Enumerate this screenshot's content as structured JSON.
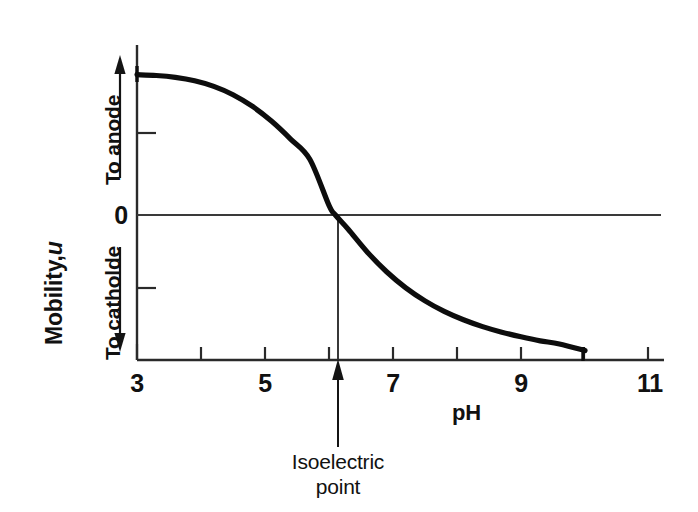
{
  "chart_data": {
    "type": "line",
    "title": "",
    "xlabel": "pH",
    "ylabel": "Mobility, u",
    "ylabel_plain": "Mobility,",
    "ylabel_italic": "u",
    "xlim": [
      3,
      11.3
    ],
    "ylim": [
      -1.12,
      1.12
    ],
    "grid": false,
    "legend": null,
    "xticks": [
      3,
      4,
      5,
      6,
      7,
      8,
      9,
      10,
      11
    ],
    "xticklabels": [
      "3",
      "",
      "5",
      "",
      "7",
      "",
      "9",
      "",
      "11"
    ],
    "xticklabels_shown": [
      "3",
      "5",
      "7",
      "9",
      "11"
    ],
    "yticks": [
      -0.55,
      0,
      0.55
    ],
    "yticklabels": [
      "",
      "0",
      ""
    ],
    "ytick_zero_label": "0",
    "zero_line": 0,
    "series": [
      {
        "name": "mobility",
        "x": [
          3.0,
          3.3,
          3.6,
          3.9,
          4.2,
          4.5,
          4.8,
          5.1,
          5.4,
          5.7,
          6.0,
          6.1,
          6.3,
          6.6,
          6.9,
          7.2,
          7.5,
          7.8,
          8.1,
          8.4,
          8.7,
          9.0,
          9.3,
          9.6,
          10.0
        ],
        "y": [
          0.905,
          0.9,
          0.888,
          0.866,
          0.83,
          0.776,
          0.702,
          0.606,
          0.49,
          0.36,
          0.062,
          0.0,
          -0.092,
          -0.24,
          -0.366,
          -0.47,
          -0.554,
          -0.622,
          -0.676,
          -0.72,
          -0.756,
          -0.786,
          -0.812,
          -0.832,
          -0.875
        ]
      }
    ],
    "annotations": [
      {
        "name": "isoelectric-point",
        "text_line1": "Isoelectric",
        "text_line2": "point",
        "x": 6.1,
        "y": 0,
        "arrow": "up"
      },
      {
        "name": "to-anode",
        "text": "To anode",
        "direction": "up",
        "region": "positive-mobility"
      },
      {
        "name": "to-catholde",
        "text": "To catholde",
        "direction": "down",
        "region": "negative-mobility"
      }
    ],
    "colors": {
      "curve": "#0d0d0d",
      "axis": "#2a2a2a",
      "zero_line": "#3a3a3a",
      "text": "#111111",
      "background": "#ffffff"
    }
  },
  "axes": {
    "x_label": "pH",
    "y_label_plain": "Mobility,",
    "y_label_italic": "u",
    "zero_label": "0"
  },
  "xtick_labels": [
    {
      "value": "3"
    },
    {
      "value": "5"
    },
    {
      "value": "7"
    },
    {
      "value": "9"
    },
    {
      "value": "11"
    }
  ],
  "direction_labels": {
    "anode": "To anode",
    "cathode": "To catholde"
  },
  "isoelectric": {
    "line1": "Isoelectric",
    "line2": "point"
  }
}
